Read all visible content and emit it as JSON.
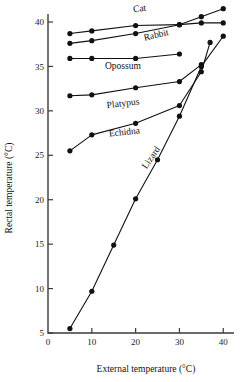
{
  "chart_data": {
    "type": "line",
    "title": "",
    "xlabel": "External temperature (°C)",
    "ylabel": "Rectal temperature (°C)",
    "xlim": [
      0,
      42
    ],
    "ylim": [
      5,
      42.5
    ],
    "xticks": [
      0,
      10,
      20,
      30,
      40
    ],
    "xtick_labels": [
      "0",
      "10",
      "20",
      "30",
      "40"
    ],
    "yticks": [
      5,
      10,
      15,
      20,
      25,
      30,
      35,
      40
    ],
    "ytick_labels": [
      "5",
      "10",
      "15",
      "20",
      "25",
      "30",
      "35",
      "40"
    ],
    "grid": false,
    "legend": "inline-labels",
    "marker": "filled-circle",
    "series": [
      {
        "name": "Cat",
        "label": "Cat",
        "label_x": 19.5,
        "label_y": 41.1,
        "label_rotate": -7,
        "x": [
          5,
          10,
          20,
          30,
          35,
          40
        ],
        "y": [
          38.7,
          39.0,
          39.6,
          39.7,
          40.6,
          41.5
        ]
      },
      {
        "name": "Rabbit",
        "label": "Rabbit",
        "label_x": 22.0,
        "label_y": 37.9,
        "label_rotate": -13,
        "x": [
          5,
          10,
          20,
          30,
          35,
          40
        ],
        "y": [
          37.6,
          37.9,
          38.7,
          39.7,
          39.9,
          39.9
        ]
      },
      {
        "name": "Opossum",
        "label": "Opossum",
        "label_x": 13.0,
        "label_y": 34.7,
        "label_rotate": 0,
        "x": [
          5,
          10,
          20,
          30
        ],
        "y": [
          35.9,
          35.9,
          35.9,
          36.4
        ]
      },
      {
        "name": "Platypus",
        "label": "Platypus",
        "label_x": 13.5,
        "label_y": 30.3,
        "label_rotate": -7,
        "x": [
          5,
          10,
          20,
          30,
          35
        ],
        "y": [
          31.7,
          31.8,
          32.6,
          33.3,
          35.2
        ]
      },
      {
        "name": "Echidna",
        "label": "Echidna",
        "label_x": 14.0,
        "label_y": 27.1,
        "label_rotate": -6,
        "x": [
          5,
          10,
          20,
          30,
          35,
          37
        ],
        "y": [
          25.5,
          27.3,
          28.6,
          30.6,
          34.4,
          37.7
        ]
      },
      {
        "name": "Lizard",
        "label": "Lizard",
        "label_x": 22.5,
        "label_y": 23.4,
        "label_rotate": -56,
        "x": [
          5,
          10,
          15,
          20,
          25,
          30,
          35,
          40
        ],
        "y": [
          5.5,
          9.7,
          14.9,
          20.1,
          24.5,
          29.4,
          35.0,
          38.4
        ]
      }
    ]
  }
}
